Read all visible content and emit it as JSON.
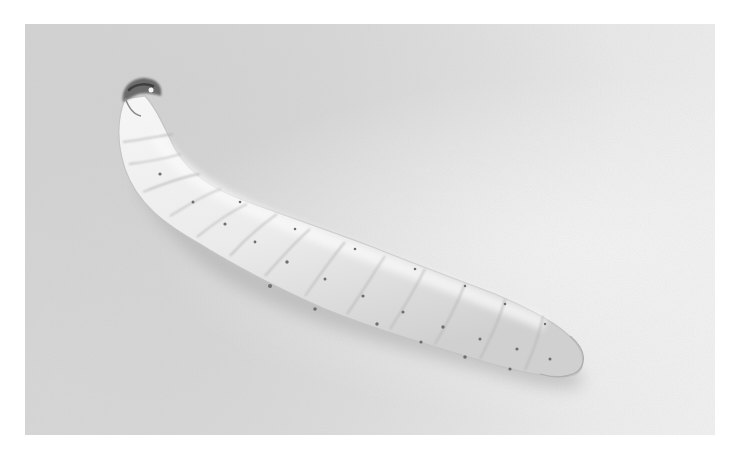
{
  "image": {
    "subject": "pale segmented larva on textured light background",
    "style": "grayscale photograph",
    "caption_visible": false
  },
  "colors": {
    "background_page": "#ffffff",
    "photo_background_light": "#f2f2f2",
    "photo_background_dark": "#d4d4d4",
    "larva_body": "#ececec",
    "larva_shadow": "#b8b8b8",
    "head_capsule": "#5a5a5a",
    "spiracle_dots": "#6e6e6e"
  },
  "top_text": {
    "visible": "clipped descenders only",
    "text": ""
  }
}
